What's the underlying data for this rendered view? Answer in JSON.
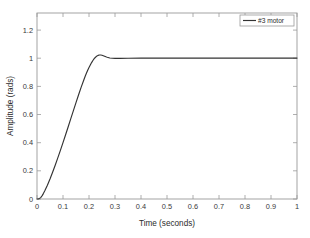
{
  "chart_data": {
    "type": "line",
    "title": "",
    "xlabel": "Time (seconds)",
    "ylabel": "Amplitude (rads)",
    "xlim": [
      0,
      1
    ],
    "ylim": [
      0,
      1.32
    ],
    "grid": false,
    "legend_position": "top-right",
    "xticks": [
      0,
      0.1,
      0.2,
      0.3,
      0.4,
      0.5,
      0.6,
      0.7,
      0.8,
      0.9,
      1
    ],
    "xticklabels": [
      "0",
      "0.1",
      "0.2",
      "0.3",
      "0.4",
      "0.5",
      "0.6",
      "0.7",
      "0.8",
      "0.9",
      "1"
    ],
    "yticks": [
      0,
      0.2,
      0.4,
      0.6,
      0.8,
      1,
      1.2
    ],
    "yticklabels": [
      "0",
      "0.2",
      "0.4",
      "0.6",
      "0.8",
      "1",
      "1.2"
    ],
    "line_color": "#333333",
    "series": [
      {
        "name": "#3 motor",
        "x": [
          0,
          0.005,
          0.01,
          0.015,
          0.02,
          0.025,
          0.03,
          0.04,
          0.05,
          0.06,
          0.07,
          0.08,
          0.09,
          0.1,
          0.11,
          0.12,
          0.13,
          0.14,
          0.15,
          0.16,
          0.17,
          0.18,
          0.185,
          0.19,
          0.195,
          0.2,
          0.205,
          0.21,
          0.215,
          0.22,
          0.225,
          0.23,
          0.235,
          0.24,
          0.245,
          0.25,
          0.255,
          0.26,
          0.265,
          0.27,
          0.28,
          0.29,
          0.3,
          0.32,
          0.35,
          0.4,
          0.45,
          0.5,
          0.55,
          0.6,
          0.65,
          0.7,
          0.75,
          0.8,
          0.85,
          0.9,
          0.95,
          1.0
        ],
        "y": [
          0,
          0.001,
          0.004,
          0.012,
          0.024,
          0.04,
          0.058,
          0.098,
          0.142,
          0.19,
          0.24,
          0.292,
          0.345,
          0.4,
          0.456,
          0.513,
          0.57,
          0.627,
          0.684,
          0.74,
          0.794,
          0.845,
          0.869,
          0.892,
          0.913,
          0.933,
          0.951,
          0.968,
          0.983,
          0.996,
          1.006,
          1.014,
          1.019,
          1.022,
          1.022,
          1.02,
          1.017,
          1.013,
          1.009,
          1.006,
          1.001,
          0.999,
          0.998,
          0.998,
          0.999,
          1.0,
          1.0,
          1.0,
          1.0,
          1.0,
          1.0,
          1.0,
          1.0,
          1.0,
          1.0,
          1.0,
          1.0,
          1.0
        ]
      }
    ]
  },
  "legend": {
    "entries": [
      {
        "label": "#3 motor",
        "color": "#333333"
      }
    ]
  },
  "axes": {
    "xlabel": "Time (seconds)",
    "ylabel": "Amplitude (rads)"
  },
  "colors": {
    "background": "#ffffff",
    "axis": "#9a9a9a",
    "line": "#333333",
    "text": "#2b2b2b"
  }
}
